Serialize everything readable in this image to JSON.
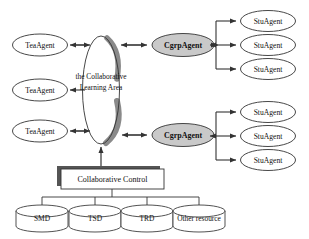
{
  "diagram": {
    "colors": {
      "stroke": "#333333",
      "text": "#111111",
      "cgrp_fill": "#c9c9c9",
      "area_shade": "#8a8a8a",
      "shadow": "#555555",
      "background": "#ffffff",
      "node_fill": "#ffffff"
    },
    "center": {
      "name": "collaborative-learning-area",
      "line1": "the  Collaborative",
      "line2": "Learning Area"
    },
    "teacher_agents": [
      {
        "label": "TeaAgent"
      },
      {
        "label": "TeaAgent"
      },
      {
        "label": "TeaAgent"
      }
    ],
    "group_agents": [
      {
        "label": "CgrpAgent"
      },
      {
        "label": "CgrpAgent"
      }
    ],
    "student_agents_group_1": [
      {
        "label": "StuAgent"
      },
      {
        "label": "StuAgent"
      },
      {
        "label": "StuAgent"
      }
    ],
    "student_agents_group_2": [
      {
        "label": "StuAgent"
      },
      {
        "label": "StuAgent"
      },
      {
        "label": "StuAgent"
      }
    ],
    "control": {
      "label": "Collaborative Control"
    },
    "resources": [
      {
        "label": "SMD"
      },
      {
        "label": "TSD"
      },
      {
        "label": "TRD"
      },
      {
        "label": "Other resource"
      }
    ]
  }
}
